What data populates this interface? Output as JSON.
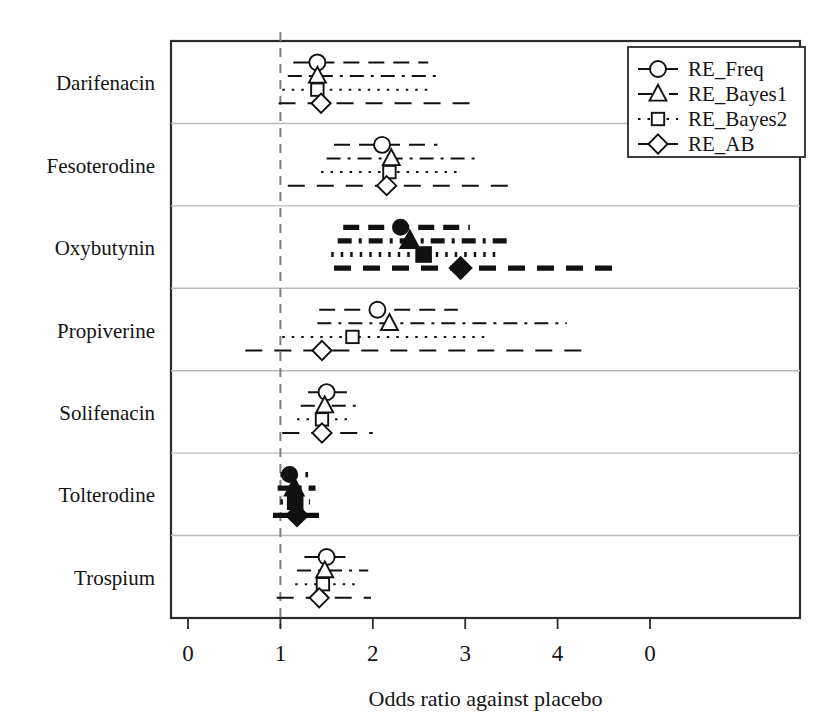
{
  "chart_data": {
    "type": "scatter",
    "subtype": "forest-plot",
    "title": "",
    "xlabel": "Odds ratio against placebo",
    "ylabel": "",
    "xlim": [
      0,
      5
    ],
    "xticks": [
      0,
      1,
      2,
      3,
      4,
      5
    ],
    "xticklabels": [
      "0",
      "1",
      "2",
      "3",
      "4",
      "0"
    ],
    "grid": false,
    "reference_line": 1,
    "legend_position": "top-right",
    "legend": [
      {
        "name": "RE_Freq",
        "marker": "circle",
        "line": "dashed"
      },
      {
        "name": "RE_Bayes1",
        "marker": "triangle",
        "line": "dashdot"
      },
      {
        "name": "RE_Bayes2",
        "marker": "square",
        "line": "dotted"
      },
      {
        "name": "RE_AB",
        "marker": "diamond",
        "line": "dashed-long"
      }
    ],
    "categories": [
      "Darifenacin",
      "Fesoterodine",
      "Oxybutynin",
      "Propiverine",
      "Solifenacin",
      "Tolterodine",
      "Trospium"
    ],
    "series": [
      {
        "name": "RE_Freq",
        "marker": "circle",
        "points": [
          {
            "category": "Darifenacin",
            "or": 1.4,
            "lo": 1.14,
            "hi": 2.6,
            "significant": false
          },
          {
            "category": "Fesoterodine",
            "or": 2.1,
            "lo": 1.58,
            "hi": 2.7,
            "significant": false
          },
          {
            "category": "Oxybutynin",
            "or": 2.3,
            "lo": 1.68,
            "hi": 3.05,
            "significant": true
          },
          {
            "category": "Propiverine",
            "or": 2.05,
            "lo": 1.42,
            "hi": 2.92,
            "significant": false
          },
          {
            "category": "Solifenacin",
            "or": 1.5,
            "lo": 1.3,
            "hi": 1.72,
            "significant": false
          },
          {
            "category": "Tolterodine",
            "or": 1.1,
            "lo": 1.0,
            "hi": 1.3,
            "significant": true
          },
          {
            "category": "Trospium",
            "or": 1.5,
            "lo": 1.26,
            "hi": 1.8,
            "significant": false
          }
        ]
      },
      {
        "name": "RE_Bayes1",
        "marker": "triangle",
        "points": [
          {
            "category": "Darifenacin",
            "or": 1.4,
            "lo": 1.08,
            "hi": 2.72,
            "significant": false
          },
          {
            "category": "Fesoterodine",
            "or": 2.2,
            "lo": 1.5,
            "hi": 3.12,
            "significant": false
          },
          {
            "category": "Oxybutynin",
            "or": 2.4,
            "lo": 1.62,
            "hi": 3.5,
            "significant": true
          },
          {
            "category": "Propiverine",
            "or": 2.18,
            "lo": 1.4,
            "hi": 4.1,
            "significant": false
          },
          {
            "category": "Solifenacin",
            "or": 1.48,
            "lo": 1.22,
            "hi": 1.86,
            "significant": false
          },
          {
            "category": "Tolterodine",
            "or": 1.15,
            "lo": 0.97,
            "hi": 1.38,
            "significant": true
          },
          {
            "category": "Trospium",
            "or": 1.48,
            "lo": 1.18,
            "hi": 1.95,
            "significant": false
          }
        ]
      },
      {
        "name": "RE_Bayes2",
        "marker": "square",
        "points": [
          {
            "category": "Darifenacin",
            "or": 1.4,
            "lo": 1.02,
            "hi": 2.62,
            "significant": false
          },
          {
            "category": "Fesoterodine",
            "or": 2.18,
            "lo": 1.44,
            "hi": 2.95,
            "significant": false
          },
          {
            "category": "Oxybutynin",
            "or": 2.55,
            "lo": 1.55,
            "hi": 3.4,
            "significant": true
          },
          {
            "category": "Propiverine",
            "or": 1.78,
            "lo": 1.02,
            "hi": 3.28,
            "significant": false
          },
          {
            "category": "Solifenacin",
            "or": 1.45,
            "lo": 1.18,
            "hi": 1.78,
            "significant": false
          },
          {
            "category": "Tolterodine",
            "or": 1.16,
            "lo": 1.0,
            "hi": 1.32,
            "significant": true
          },
          {
            "category": "Trospium",
            "or": 1.46,
            "lo": 1.16,
            "hi": 1.82,
            "significant": false
          }
        ]
      },
      {
        "name": "RE_AB",
        "marker": "diamond",
        "points": [
          {
            "category": "Darifenacin",
            "or": 1.44,
            "lo": 0.98,
            "hi": 3.05,
            "significant": false
          },
          {
            "category": "Fesoterodine",
            "or": 2.15,
            "lo": 1.08,
            "hi": 3.52,
            "significant": false
          },
          {
            "category": "Oxybutynin",
            "or": 2.95,
            "lo": 1.58,
            "hi": 4.62,
            "significant": true
          },
          {
            "category": "Propiverine",
            "or": 1.45,
            "lo": 0.62,
            "hi": 4.35,
            "significant": false
          },
          {
            "category": "Solifenacin",
            "or": 1.45,
            "lo": 1.02,
            "hi": 2.0,
            "significant": false
          },
          {
            "category": "Tolterodine",
            "or": 1.18,
            "lo": 0.92,
            "hi": 1.44,
            "significant": true
          },
          {
            "category": "Trospium",
            "or": 1.42,
            "lo": 0.96,
            "hi": 1.98,
            "significant": false
          }
        ]
      }
    ]
  }
}
